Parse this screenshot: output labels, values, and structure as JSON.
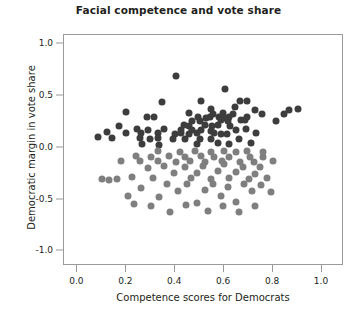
{
  "chart_data": {
    "type": "scatter",
    "title": "Facial competence and vote share",
    "xlabel": "Competence scores for Democrats",
    "ylabel": "Democratic margin in vote share",
    "xlim": [
      -0.055,
      1.09
    ],
    "ylim": [
      -1.14,
      1.09
    ],
    "xticks": [
      0.0,
      0.2,
      0.4,
      0.6,
      0.8,
      1.0
    ],
    "xticklabels": [
      "0.0",
      "0.2",
      "0.4",
      "0.6",
      "0.8",
      "1.0"
    ],
    "yticks": [
      1.0,
      0.5,
      0.0,
      -0.5,
      -1.0
    ],
    "yticklabels": [
      "1.0",
      "0.5",
      "0.0",
      "-0.5",
      "-1.0"
    ],
    "grid": false,
    "legend": null,
    "colors": {
      "winner": "#3d3d3d",
      "loser": "#7f7f7f",
      "axis": "#9a9a9a",
      "text": "#231f20",
      "background": "#ffffff"
    },
    "series": [
      {
        "name": "Democratic winners",
        "color": "#3d3d3d",
        "points": [
          [
            0.405,
            0.695
          ],
          [
            0.605,
            0.565
          ],
          [
            0.345,
            0.445
          ],
          [
            0.505,
            0.455
          ],
          [
            0.665,
            0.455
          ],
          [
            0.695,
            0.45
          ],
          [
            0.645,
            0.395
          ],
          [
            0.545,
            0.375
          ],
          [
            0.725,
            0.37
          ],
          [
            0.865,
            0.365
          ],
          [
            0.2,
            0.345
          ],
          [
            0.455,
            0.34
          ],
          [
            0.555,
            0.33
          ],
          [
            0.595,
            0.335
          ],
          [
            0.635,
            0.33
          ],
          [
            0.755,
            0.33
          ],
          [
            0.845,
            0.33
          ],
          [
            0.285,
            0.3
          ],
          [
            0.315,
            0.3
          ],
          [
            0.495,
            0.295
          ],
          [
            0.525,
            0.29
          ],
          [
            0.54,
            0.3
          ],
          [
            0.58,
            0.3
          ],
          [
            0.605,
            0.29
          ],
          [
            0.62,
            0.3
          ],
          [
            0.695,
            0.295
          ],
          [
            0.47,
            0.26
          ],
          [
            0.5,
            0.255
          ],
          [
            0.585,
            0.265
          ],
          [
            0.615,
            0.255
          ],
          [
            0.67,
            0.27
          ],
          [
            0.685,
            0.265
          ],
          [
            0.81,
            0.255
          ],
          [
            0.435,
            0.22
          ],
          [
            0.455,
            0.215
          ],
          [
            0.52,
            0.225
          ],
          [
            0.55,
            0.215
          ],
          [
            0.575,
            0.22
          ],
          [
            0.625,
            0.215
          ],
          [
            0.17,
            0.215
          ],
          [
            0.245,
            0.18
          ],
          [
            0.29,
            0.175
          ],
          [
            0.355,
            0.18
          ],
          [
            0.425,
            0.175
          ],
          [
            0.47,
            0.17
          ],
          [
            0.505,
            0.175
          ],
          [
            0.545,
            0.165
          ],
          [
            0.65,
            0.17
          ],
          [
            0.69,
            0.18
          ],
          [
            0.12,
            0.15
          ],
          [
            0.2,
            0.145
          ],
          [
            0.26,
            0.145
          ],
          [
            0.33,
            0.14
          ],
          [
            0.4,
            0.135
          ],
          [
            0.425,
            0.145
          ],
          [
            0.455,
            0.135
          ],
          [
            0.49,
            0.14
          ],
          [
            0.56,
            0.14
          ],
          [
            0.585,
            0.135
          ],
          [
            0.61,
            0.135
          ],
          [
            0.73,
            0.14
          ],
          [
            0.085,
            0.11
          ],
          [
            0.14,
            0.095
          ],
          [
            0.255,
            0.095
          ],
          [
            0.295,
            0.09
          ],
          [
            0.33,
            0.095
          ],
          [
            0.39,
            0.09
          ],
          [
            0.44,
            0.085
          ],
          [
            0.5,
            0.09
          ],
          [
            0.545,
            0.085
          ],
          [
            0.66,
            0.09
          ],
          [
            0.9,
            0.375
          ],
          [
            0.49,
            0.04
          ],
          [
            0.575,
            0.045
          ],
          [
            0.62,
            0.04
          ],
          [
            0.71,
            0.045
          ],
          [
            0.265,
            0.035
          ],
          [
            0.335,
            0.03
          ]
        ]
      },
      {
        "name": "Democratic losers",
        "color": "#7f7f7f",
        "points": [
          [
            0.33,
            -0.03
          ],
          [
            0.42,
            -0.035
          ],
          [
            0.48,
            -0.03
          ],
          [
            0.545,
            -0.035
          ],
          [
            0.6,
            -0.03
          ],
          [
            0.65,
            -0.035
          ],
          [
            0.695,
            -0.03
          ],
          [
            0.76,
            -0.035
          ],
          [
            0.24,
            -0.08
          ],
          [
            0.3,
            -0.085
          ],
          [
            0.375,
            -0.08
          ],
          [
            0.44,
            -0.085
          ],
          [
            0.505,
            -0.08
          ],
          [
            0.56,
            -0.09
          ],
          [
            0.62,
            -0.085
          ],
          [
            0.705,
            -0.085
          ],
          [
            0.76,
            -0.09
          ],
          [
            0.18,
            -0.125
          ],
          [
            0.255,
            -0.13
          ],
          [
            0.33,
            -0.125
          ],
          [
            0.405,
            -0.135
          ],
          [
            0.46,
            -0.13
          ],
          [
            0.52,
            -0.135
          ],
          [
            0.59,
            -0.13
          ],
          [
            0.665,
            -0.135
          ],
          [
            0.72,
            -0.135
          ],
          [
            0.8,
            -0.13
          ],
          [
            0.1,
            -0.3
          ],
          [
            0.13,
            -0.305
          ],
          [
            0.16,
            -0.3
          ],
          [
            0.225,
            -0.285
          ],
          [
            0.29,
            -0.19
          ],
          [
            0.31,
            -0.295
          ],
          [
            0.355,
            -0.175
          ],
          [
            0.395,
            -0.245
          ],
          [
            0.44,
            -0.185
          ],
          [
            0.465,
            -0.29
          ],
          [
            0.49,
            -0.245
          ],
          [
            0.515,
            -0.175
          ],
          [
            0.545,
            -0.3
          ],
          [
            0.575,
            -0.22
          ],
          [
            0.6,
            -0.16
          ],
          [
            0.62,
            -0.29
          ],
          [
            0.65,
            -0.235
          ],
          [
            0.675,
            -0.18
          ],
          [
            0.7,
            -0.3
          ],
          [
            0.725,
            -0.25
          ],
          [
            0.745,
            -0.185
          ],
          [
            0.775,
            -0.295
          ],
          [
            0.26,
            -0.39
          ],
          [
            0.335,
            -0.47
          ],
          [
            0.365,
            -0.35
          ],
          [
            0.41,
            -0.42
          ],
          [
            0.45,
            -0.345
          ],
          [
            0.49,
            -0.53
          ],
          [
            0.52,
            -0.41
          ],
          [
            0.555,
            -0.345
          ],
          [
            0.585,
            -0.46
          ],
          [
            0.615,
            -0.38
          ],
          [
            0.65,
            -0.52
          ],
          [
            0.68,
            -0.345
          ],
          [
            0.715,
            -0.42
          ],
          [
            0.75,
            -0.355
          ],
          [
            0.3,
            -0.56
          ],
          [
            0.38,
            -0.62
          ],
          [
            0.445,
            -0.555
          ],
          [
            0.535,
            -0.61
          ],
          [
            0.595,
            -0.56
          ],
          [
            0.66,
            -0.62
          ],
          [
            0.725,
            -0.56
          ],
          [
            0.205,
            -0.465
          ],
          [
            0.23,
            -0.545
          ],
          [
            0.79,
            -0.43
          ]
        ]
      }
    ]
  }
}
